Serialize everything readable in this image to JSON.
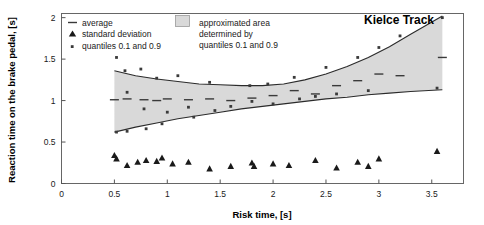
{
  "chart_data": {
    "type": "line",
    "title": "Kielce Track",
    "xlabel": "Risk time, [s]",
    "ylabel": "Reaction time on the brake pedal, [s]",
    "xlim": [
      0,
      3.8
    ],
    "ylim": [
      0,
      2.05
    ],
    "xticks": [
      "0",
      "0.5",
      "1",
      "1.5",
      "2",
      "2.5",
      "3",
      "3.5"
    ],
    "xtick_values": [
      0,
      0.5,
      1,
      1.5,
      2,
      2.5,
      3,
      3.5
    ],
    "yticks": [
      "0",
      "0.5",
      "1",
      "1.5",
      "2"
    ],
    "ytick_values": [
      0,
      0.5,
      1,
      1.5,
      2
    ],
    "grid": false,
    "legend_position": "top-left",
    "band_color": "#d9d9d9",
    "series": [
      {
        "name": "quantile 0.9 curve",
        "type": "line",
        "x": [
          0.5,
          0.7,
          0.9,
          1.1,
          1.3,
          1.5,
          1.7,
          1.9,
          2.1,
          2.3,
          2.5,
          2.7,
          2.9,
          3.1,
          3.3,
          3.6
        ],
        "values": [
          1.36,
          1.3,
          1.26,
          1.23,
          1.2,
          1.19,
          1.18,
          1.18,
          1.2,
          1.25,
          1.32,
          1.41,
          1.52,
          1.65,
          1.8,
          2.02
        ]
      },
      {
        "name": "quantile 0.1 curve",
        "type": "line",
        "x": [
          0.5,
          0.7,
          0.9,
          1.1,
          1.3,
          1.5,
          1.7,
          1.9,
          2.1,
          2.3,
          2.5,
          2.7,
          2.9,
          3.1,
          3.3,
          3.6
        ],
        "values": [
          0.62,
          0.68,
          0.73,
          0.78,
          0.82,
          0.86,
          0.9,
          0.93,
          0.96,
          0.99,
          1.02,
          1.04,
          1.07,
          1.09,
          1.11,
          1.13
        ]
      },
      {
        "name": "average",
        "type": "marker-dash",
        "x": [
          0.5,
          0.62,
          0.78,
          0.9,
          1.0,
          1.2,
          1.4,
          1.6,
          1.8,
          2.0,
          2.2,
          2.4,
          2.6,
          2.8,
          3.0,
          3.2,
          3.6
        ],
        "values": [
          1.01,
          1.02,
          1.01,
          1.0,
          1.02,
          1.01,
          1.02,
          1.0,
          1.03,
          1.06,
          1.12,
          1.08,
          1.18,
          1.24,
          1.32,
          1.3,
          1.52
        ]
      },
      {
        "name": "quantiles 0.1 and 0.9",
        "type": "scatter",
        "x": [
          0.52,
          0.52,
          0.6,
          0.62,
          0.62,
          0.75,
          0.78,
          0.8,
          0.9,
          0.95,
          1.0,
          1.1,
          1.2,
          1.25,
          1.4,
          1.45,
          1.6,
          1.78,
          1.8,
          1.95,
          2.0,
          2.2,
          2.25,
          2.4,
          2.5,
          2.6,
          2.8,
          2.9,
          3.0,
          3.2,
          3.55,
          3.6
        ],
        "values": [
          1.52,
          0.62,
          1.36,
          1.1,
          0.63,
          1.38,
          0.9,
          0.66,
          1.27,
          0.72,
          0.86,
          1.3,
          0.92,
          0.8,
          1.22,
          0.88,
          0.93,
          1.18,
          0.99,
          1.2,
          0.96,
          1.28,
          1.02,
          1.05,
          1.4,
          1.08,
          1.52,
          1.12,
          1.64,
          1.78,
          1.15,
          2.0
        ]
      },
      {
        "name": "standard deviation",
        "type": "scatter",
        "x": [
          0.5,
          0.52,
          0.62,
          0.72,
          0.8,
          0.9,
          0.95,
          1.05,
          1.2,
          1.4,
          1.6,
          1.8,
          1.82,
          2.0,
          2.15,
          2.4,
          2.6,
          2.8,
          2.9,
          3.0,
          3.55
        ],
        "values": [
          0.34,
          0.3,
          0.22,
          0.26,
          0.28,
          0.27,
          0.31,
          0.24,
          0.26,
          0.18,
          0.21,
          0.25,
          0.21,
          0.24,
          0.22,
          0.28,
          0.19,
          0.26,
          0.21,
          0.3,
          0.39
        ]
      }
    ]
  },
  "legend": {
    "items": [
      {
        "label": "average",
        "marker": "dash"
      },
      {
        "label": "standard deviation",
        "marker": "triangle"
      },
      {
        "label": "quantiles 0.1 and 0.9",
        "marker": "dot"
      }
    ],
    "area_note": {
      "line1": "approximated area",
      "line2": "determined by",
      "line3": "quantiles 0.1 and 0.9",
      "swatch_color": "#d9d9d9"
    }
  }
}
